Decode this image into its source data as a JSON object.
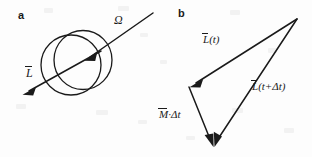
{
  "figure": {
    "background_color": "#fdfdfd",
    "ink_color": "#1a1a1a",
    "width": 312,
    "height": 157
  },
  "panel_a": {
    "letter": "a",
    "sphere": {
      "name": "spinning-sphere",
      "outline_circle": {
        "cx": 72,
        "cy": 64,
        "r": 30
      },
      "meridian_circle": {
        "cx": 82,
        "cy": 60,
        "r": 29
      }
    },
    "vectors": [
      {
        "name": "angular-velocity-vector",
        "symbol": "Ω",
        "label_plain": "Omega",
        "has_overbar": false,
        "direction": "down-left into sphere",
        "from": [
          152,
          14
        ],
        "to": [
          86,
          60
        ]
      },
      {
        "name": "angular-momentum-vector",
        "symbol": "L",
        "label_plain": "L",
        "has_overbar": true,
        "direction": "down-left from sphere center",
        "from": [
          100,
          52
        ],
        "to": [
          23,
          94
        ]
      }
    ]
  },
  "panel_b": {
    "letter": "b",
    "triangle": {
      "apex_top_right": [
        297,
        19
      ],
      "vertex_left": [
        189,
        87
      ],
      "vertex_bottom": [
        215,
        147
      ]
    },
    "vectors": [
      {
        "name": "angular-momentum-at-t-vector",
        "base_symbol": "L",
        "has_overbar": true,
        "argument": "(t)",
        "label_plain": "L(t)",
        "from": [
          297,
          19
        ],
        "to": [
          189,
          87
        ]
      },
      {
        "name": "torque-times-dt-vector",
        "base_symbol": "M",
        "has_overbar": true,
        "argument": "·Δt",
        "label_plain": "M·Δt",
        "from": [
          189,
          87
        ],
        "to": [
          215,
          147
        ]
      },
      {
        "name": "angular-momentum-at-t-plus-dt-vector",
        "base_symbol": "L",
        "has_overbar": true,
        "argument": "(t+Δt)",
        "label_plain": "L(t+Δt)",
        "from": [
          297,
          19
        ],
        "to": [
          215,
          147
        ]
      }
    ]
  },
  "labels": {
    "panel_a_letter": "a",
    "panel_b_letter": "b",
    "omega": "Ω",
    "L_symbol": "L",
    "M_symbol": "M",
    "arg_t": "(t)",
    "arg_t_plus_dt": "(t+Δt)",
    "arg_dot_dt": "·Δt"
  }
}
